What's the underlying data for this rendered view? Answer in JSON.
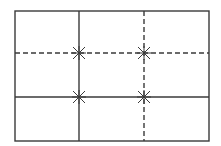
{
  "diagram": {
    "type": "rule-of-thirds-grid",
    "colors": {
      "stroke": "#3a3a3a",
      "background": "#ffffff"
    },
    "frame": {
      "x": 15,
      "y": 11,
      "width": 194,
      "height": 130
    },
    "solid_lines": [
      {
        "orientation": "vertical",
        "position": 79
      },
      {
        "orientation": "horizontal",
        "position": 97
      }
    ],
    "dashed_lines": [
      {
        "orientation": "vertical",
        "position": 144
      },
      {
        "orientation": "horizontal",
        "position": 53
      }
    ],
    "intersections": [
      {
        "x": 79,
        "y": 53
      },
      {
        "x": 144,
        "y": 53
      },
      {
        "x": 79,
        "y": 97
      },
      {
        "x": 144,
        "y": 97
      }
    ]
  }
}
